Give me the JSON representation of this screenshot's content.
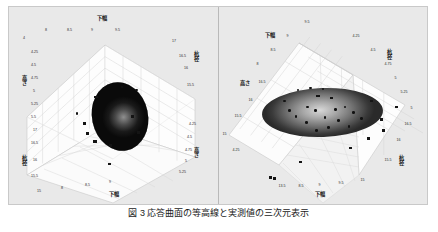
{
  "figure": {
    "background_color": "#e9e9e9",
    "panel_background": "#fdfdfd",
    "grid_color": "#c7c7c7",
    "marker_color": "#141414",
    "caption": "図 3  応答曲面の等高線と実測値の三次元表示"
  },
  "panels": [
    {
      "id": "left",
      "name": "left-response-surface",
      "top_axis_label": "下幅",
      "left_axis_label": "高さ",
      "right_axis_label": "杭径",
      "bottom_left_axis_label": "杭径",
      "bottom_right_axis_label": "高さ",
      "bottom_axis_label": "下幅",
      "ticks": {
        "top": [
          "4",
          "8",
          "8.5",
          "9",
          "9.5"
        ],
        "left_upper": [
          "4.25",
          "4.5",
          "4.75",
          "5",
          "5.25",
          "5.5"
        ],
        "left_lower": [
          "17",
          "16.5",
          "16",
          "15.5"
        ],
        "right_upper": [
          "17",
          "16.5",
          "16",
          "15.5"
        ],
        "right_lower": [
          "4.25",
          "4.5",
          "4.75",
          "5",
          "5.25"
        ],
        "bottom": [
          "15",
          "8",
          "8.5",
          "9"
        ]
      },
      "blob": {
        "shape": "egg",
        "fill_description": "dark mottled ellipsoid",
        "center_x_pct": 50,
        "center_y_pct": 52,
        "width_pct": 26,
        "height_pct": 33,
        "rotation_deg": -12
      }
    },
    {
      "id": "right",
      "name": "right-response-surface",
      "top_axis_label": "下幅",
      "left_axis_label": "高さ",
      "right_axis_label": "杭径",
      "bottom_right_axis_label": "杭径",
      "bottom_axis_label": "下幅",
      "ticks": {
        "top": [
          "9.5",
          "9",
          "8.5",
          "8"
        ],
        "top_right": [
          "4.25",
          "4.5",
          "4.75",
          "5",
          "5.25"
        ],
        "left": [
          "16.5",
          "16",
          "15.5",
          "15",
          "4.25"
        ],
        "right": [
          "5",
          "16.5",
          "16",
          "15.5"
        ],
        "bottom": [
          "13.5",
          "8.5",
          "9",
          "9.5",
          "15"
        ]
      },
      "blob": {
        "shape": "flat-ellipse",
        "fill_description": "gray ellipse with light center",
        "center_x_pct": 50,
        "center_y_pct": 53,
        "width_pct": 56,
        "height_pct": 24,
        "rotation_deg": -2
      }
    }
  ],
  "left_markers": {
    "circles": [
      {
        "x": 45.0,
        "y": 40.5
      },
      {
        "x": 53.5,
        "y": 40.0
      },
      {
        "x": 60.5,
        "y": 41.5
      },
      {
        "x": 32.0,
        "y": 53.5
      }
    ],
    "squares": [
      {
        "x": 41.0,
        "y": 45.0
      },
      {
        "x": 35.5,
        "y": 58.5
      },
      {
        "x": 37.0,
        "y": 63.5
      },
      {
        "x": 40.5,
        "y": 67.5
      },
      {
        "x": 48.0,
        "y": 69.5
      },
      {
        "x": 47.5,
        "y": 79.0
      },
      {
        "x": 61.5,
        "y": 63.0
      },
      {
        "x": 58.5,
        "y": 55.0
      }
    ]
  },
  "right_markers": {
    "circles": [
      {
        "x": 31.0,
        "y": 47.0
      },
      {
        "x": 37.5,
        "y": 41.5
      },
      {
        "x": 43.5,
        "y": 40.5
      },
      {
        "x": 49.5,
        "y": 41.0
      },
      {
        "x": 42.0,
        "y": 50.0
      },
      {
        "x": 46.0,
        "y": 52.0
      },
      {
        "x": 50.5,
        "y": 55.5
      },
      {
        "x": 55.5,
        "y": 51.5
      },
      {
        "x": 60.0,
        "y": 50.0
      },
      {
        "x": 64.0,
        "y": 53.0
      },
      {
        "x": 57.0,
        "y": 57.0
      },
      {
        "x": 52.0,
        "y": 60.5
      },
      {
        "x": 46.5,
        "y": 62.0
      },
      {
        "x": 41.5,
        "y": 58.0
      },
      {
        "x": 36.5,
        "y": 55.0
      },
      {
        "x": 33.5,
        "y": 52.0
      },
      {
        "x": 68.0,
        "y": 56.0
      },
      {
        "x": 62.0,
        "y": 60.0
      }
    ],
    "squares": [
      {
        "x": 47.0,
        "y": 44.5
      },
      {
        "x": 53.5,
        "y": 45.5
      },
      {
        "x": 72.5,
        "y": 47.0
      },
      {
        "x": 84.5,
        "y": 50.0
      },
      {
        "x": 77.5,
        "y": 56.5
      },
      {
        "x": 78.5,
        "y": 62.0
      },
      {
        "x": 71.0,
        "y": 66.0
      },
      {
        "x": 62.5,
        "y": 71.0
      },
      {
        "x": 38.5,
        "y": 78.0
      },
      {
        "x": 24.0,
        "y": 86.0
      },
      {
        "x": 26.0,
        "y": 86.5
      }
    ]
  }
}
